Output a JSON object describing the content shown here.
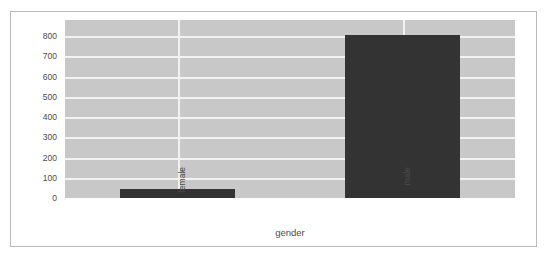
{
  "chart_data": {
    "type": "bar",
    "title": "",
    "subtitle": "",
    "xlabel": "gender",
    "ylabel": "",
    "categories": [
      "female",
      "male"
    ],
    "values": [
      45,
      805
    ],
    "series": [
      {
        "name": "count",
        "values": [
          45,
          805
        ]
      }
    ],
    "yticks": [
      0,
      100,
      200,
      300,
      400,
      500,
      600,
      700,
      800
    ],
    "ytick_labels": [
      "0",
      "100",
      "200",
      "300",
      "400",
      "500",
      "600",
      "700",
      "800"
    ],
    "ylim": [
      0,
      880
    ],
    "xtick_labels": [
      "female",
      "male"
    ],
    "grid": true,
    "grid_color": "#f2f2f2",
    "legend": false,
    "legend_position": "none",
    "plot_background": "#c8c8c8",
    "figure_background": "#ffffff",
    "bar_color": "#333333",
    "frame_color": "#b9b9b9",
    "text_color": "#4a4a4a",
    "annotations": []
  }
}
